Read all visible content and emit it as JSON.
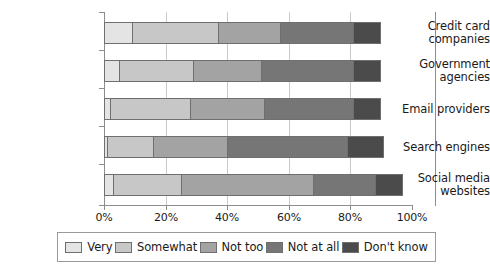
{
  "chart_data": {
    "type": "bar",
    "orientation": "horizontal",
    "stacked": true,
    "title": "",
    "subtitle": "",
    "xlabel": "",
    "ylabel": "",
    "xlim": [
      0,
      100
    ],
    "xticks": [
      0,
      20,
      40,
      60,
      80,
      100
    ],
    "xtick_labels": [
      "0%",
      "20%",
      "40%",
      "60%",
      "80%",
      "100%"
    ],
    "grid": true,
    "legend_position": "bottom",
    "categories": [
      "Credit card companies",
      "Government agencies",
      "Email providers",
      "Search engines",
      "Social media websites"
    ],
    "category_lines": [
      [
        "Credit card",
        "companies"
      ],
      [
        "Government",
        "agencies"
      ],
      [
        "Email providers"
      ],
      [
        "Search engines"
      ],
      [
        "Social media",
        "websites"
      ]
    ],
    "series": [
      {
        "name": "Very",
        "color": "#e4e4e4",
        "values": [
          9,
          5,
          2,
          1,
          3
        ]
      },
      {
        "name": "Somewhat",
        "color": "#c7c7c7",
        "values": [
          28,
          24,
          26,
          15,
          22
        ]
      },
      {
        "name": "Not too",
        "color": "#a3a3a3",
        "values": [
          20,
          22,
          24,
          24,
          43
        ]
      },
      {
        "name": "Not at all",
        "color": "#767676",
        "values": [
          24,
          30,
          29,
          39,
          20
        ]
      },
      {
        "name": "Don't know",
        "color": "#4b4b4b",
        "values": [
          9,
          9,
          9,
          12,
          9
        ]
      }
    ]
  },
  "legend": {
    "items": [
      {
        "label": "Very",
        "color": "#e4e4e4"
      },
      {
        "label": "Somewhat",
        "color": "#c7c7c7"
      },
      {
        "label": "Not too",
        "color": "#a3a3a3"
      },
      {
        "label": "Not at all",
        "color": "#767676"
      },
      {
        "label": "Don't know",
        "color": "#4b4b4b"
      }
    ]
  }
}
